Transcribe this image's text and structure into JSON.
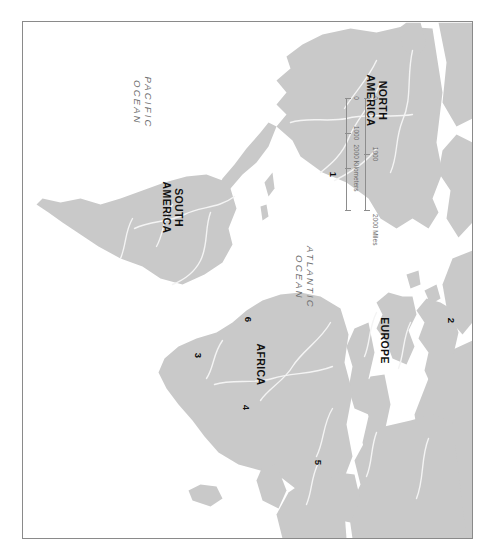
{
  "map": {
    "projection_note": "world map, rotated 90 degrees clockwise in the screenshot",
    "frame_border_color": "#8a8a8a",
    "land_color": "#c9c9c9",
    "ocean_color": "#ffffff",
    "river_color": "#f2f2f2",
    "continents": [
      {
        "id": "north-america",
        "label": "NORTH\nAMERICA",
        "x": 78,
        "y": 96
      },
      {
        "id": "south-america",
        "label": "SOUTH\nAMERICA",
        "x": 185,
        "y": 300
      },
      {
        "id": "europe",
        "label": "EUROPE",
        "x": 318,
        "y": 88
      },
      {
        "id": "africa",
        "label": "AFRICA",
        "x": 342,
        "y": 212
      }
    ],
    "oceans": [
      {
        "id": "atlantic-ocean",
        "label": "ATLANTIC\nOCEAN",
        "x": 255,
        "y": 168
      },
      {
        "id": "pacific-ocean",
        "label": "PACIFIC\nOCEAN",
        "x": 80,
        "y": 330
      }
    ],
    "markers": [
      {
        "id": "marker-1",
        "label": "1",
        "x": 152,
        "y": 140
      },
      {
        "id": "marker-2",
        "label": "2",
        "x": 298,
        "y": 22
      },
      {
        "id": "marker-3",
        "label": "3",
        "x": 333,
        "y": 275
      },
      {
        "id": "marker-4",
        "label": "4",
        "x": 385,
        "y": 227
      },
      {
        "id": "marker-5",
        "label": "5",
        "x": 440,
        "y": 155
      },
      {
        "id": "marker-6",
        "label": "6",
        "x": 297,
        "y": 225
      }
    ]
  },
  "scalebar": {
    "miles": {
      "unit_label": "2000 Miles",
      "ticks": [
        "0",
        "1000",
        "2000"
      ],
      "tick_positions": [
        0,
        56,
        112
      ]
    },
    "kilometers": {
      "unit_label": "2000 Kilometers",
      "ticks": [
        "0",
        "1000",
        "2000"
      ],
      "tick_positions": [
        0,
        35,
        70
      ]
    }
  }
}
